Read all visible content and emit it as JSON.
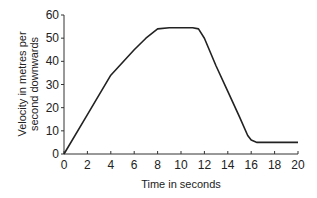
{
  "chart_data": {
    "type": "line",
    "title": "",
    "xlabel": "Time in seconds",
    "ylabel": "Velocity in metres per second downwards",
    "ylabel_lines": [
      "Velocity in metres per",
      "second downwards"
    ],
    "xlim": [
      0,
      20
    ],
    "ylim": [
      0,
      60
    ],
    "x_ticks": [
      0,
      2,
      4,
      6,
      8,
      10,
      12,
      14,
      16,
      18,
      20
    ],
    "y_ticks": [
      0,
      10,
      20,
      30,
      40,
      50,
      60
    ],
    "grid": false,
    "legend": null,
    "series": [
      {
        "name": "Velocity",
        "x": [
          0,
          2,
          4,
          6,
          7,
          8,
          9,
          10,
          11,
          11.5,
          12,
          13,
          14,
          15,
          15.7,
          16,
          16.5,
          17,
          18,
          19,
          20
        ],
        "values": [
          0,
          17,
          34,
          45,
          50,
          54,
          54.5,
          54.5,
          54.5,
          54,
          50,
          38,
          27,
          16,
          8,
          6,
          5,
          5,
          5,
          5,
          5
        ]
      }
    ],
    "color": "#222222"
  }
}
